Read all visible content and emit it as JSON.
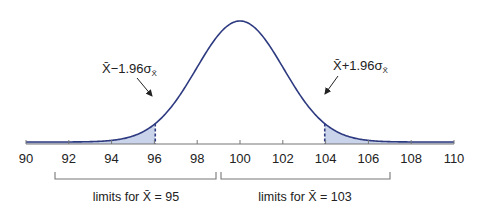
{
  "chart_data": {
    "type": "area",
    "title": "",
    "xlabel": "",
    "ylabel": "",
    "distribution": "normal",
    "mean": 100,
    "sd": 2.04,
    "xlim": [
      90,
      110
    ],
    "grid": false,
    "x_ticks": [
      90,
      92,
      94,
      96,
      98,
      100,
      102,
      104,
      106,
      108,
      110
    ],
    "x_tick_labels": [
      "90",
      "92",
      "94",
      "96",
      "98",
      "100",
      "102",
      "104",
      "106",
      "108",
      "110"
    ],
    "shaded_regions": [
      {
        "name": "lower-tail",
        "from": 90,
        "to": 96.04
      },
      {
        "name": "upper-tail",
        "from": 103.96,
        "to": 110
      }
    ],
    "critical_values": [
      96.04,
      103.96
    ],
    "annotations": [
      {
        "text_main": "X̄−1.96σ",
        "text_sub": "X̄",
        "points_to": 96.04
      },
      {
        "text_main": "X̄+1.96σ",
        "text_sub": "X̄",
        "points_to": 103.96
      }
    ],
    "brackets": [
      {
        "from": 91.4,
        "to": 98.9,
        "label": "limits for X̄ = 95"
      },
      {
        "from": 99.1,
        "to": 107.0,
        "label": "limits for X̄ = 103"
      }
    ],
    "colors": {
      "curve": "#2e3a80",
      "fill": "#c9d3ea",
      "axis": "#777777",
      "dashed": "#2e3a80"
    }
  },
  "labels": {
    "left_annot_main": "X̄−1.96σ",
    "left_annot_sub": "X̄",
    "right_annot_main": "X̄+1.96σ",
    "right_annot_sub": "X̄",
    "bracket_left": "limits for X̄ = 95",
    "bracket_right": "limits for X̄ = 103"
  }
}
